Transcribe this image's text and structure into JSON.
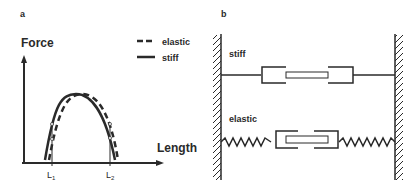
{
  "panel_a": {
    "label": "a",
    "y_axis_label": "Force",
    "x_axis_label": "Length",
    "x_ticks": [
      {
        "main": "L",
        "sub": "1"
      },
      {
        "main": "L",
        "sub": "2"
      }
    ],
    "legend": [
      {
        "name": "elastic",
        "style": "dashed"
      },
      {
        "name": "stiff",
        "style": "solid"
      }
    ]
  },
  "panel_b": {
    "label": "b",
    "rows": [
      {
        "name": "stiff",
        "connector": "straight-line"
      },
      {
        "name": "elastic",
        "connector": "spring"
      }
    ]
  },
  "colors": {
    "ink": "#2a2a2a",
    "background": "#ffffff"
  }
}
